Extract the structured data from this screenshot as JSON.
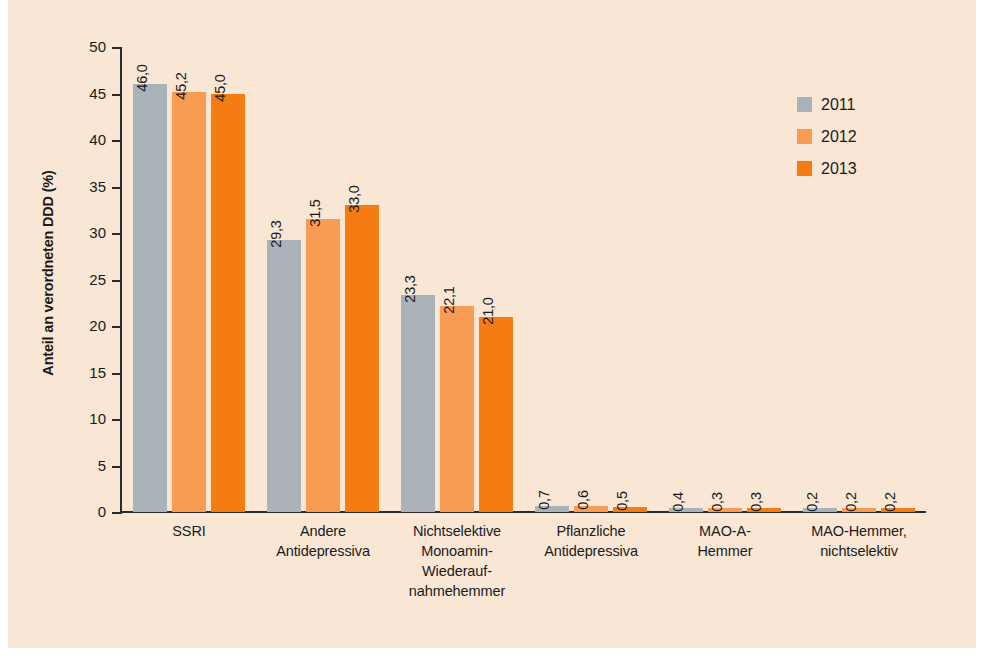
{
  "chart_data": {
    "type": "bar",
    "title": "",
    "subtitle": "",
    "xlabel": "",
    "ylabel": "Anteil an verordneten DDD (%)",
    "ylim": [
      0,
      50
    ],
    "yticks": [
      0,
      5,
      10,
      15,
      20,
      25,
      30,
      35,
      40,
      45,
      50
    ],
    "ytick_labels": [
      "0",
      "5",
      "10",
      "15",
      "20",
      "25",
      "30",
      "35",
      "40",
      "45",
      "50"
    ],
    "grid": false,
    "legend_position": "top-right",
    "decimal_separator": ",",
    "categories": [
      "SSRI",
      "Andere\nAntidepressiva",
      "Nichtselektive\nMonoamin-\nWiederauf-\nnahmehemmer",
      "Pflanzliche\nAntidepressiva",
      "MAO-A-\nHemmer",
      "MAO-Hemmer,\nnichtselektiv"
    ],
    "category_lines": [
      [
        "SSRI"
      ],
      [
        "Andere",
        "Antidepressiva"
      ],
      [
        "Nichtselektive",
        "Monoamin-",
        "Wiederauf-",
        "nahmehemmer"
      ],
      [
        "Pflanzliche",
        "Antidepressiva"
      ],
      [
        "MAO-A-",
        "Hemmer"
      ],
      [
        "MAO-Hemmer,",
        "nichtselektiv"
      ]
    ],
    "series": [
      {
        "name": "2011",
        "color": "#a9b2b9",
        "values": [
          46.0,
          29.3,
          23.3,
          0.7,
          0.4,
          0.2
        ],
        "labels": [
          "46,0",
          "29,3",
          "23,3",
          "0,7",
          "0,4",
          "0,2"
        ]
      },
      {
        "name": "2012",
        "color": "#f89c55",
        "values": [
          45.2,
          31.5,
          22.1,
          0.6,
          0.3,
          0.2
        ],
        "labels": [
          "45,2",
          "31,5",
          "22,1",
          "0,6",
          "0,3",
          "0,2"
        ]
      },
      {
        "name": "2013",
        "color": "#f47c13",
        "values": [
          45.0,
          33.0,
          21.0,
          0.5,
          0.3,
          0.2
        ],
        "labels": [
          "45,0",
          "33,0",
          "21,0",
          "0,5",
          "0,3",
          "0,2"
        ]
      }
    ]
  },
  "legend": {
    "items": [
      {
        "label": "2011",
        "color": "#a9b2b9"
      },
      {
        "label": "2012",
        "color": "#f89c55"
      },
      {
        "label": "2013",
        "color": "#f47c13"
      }
    ]
  },
  "colors": {
    "background": "#f9e6d4",
    "page": "#ffffff",
    "axis": "#2b2b2b",
    "text": "#1a1a1a",
    "series_2011": "#a9b2b9",
    "series_2012": "#f89c55",
    "series_2013": "#f47c13"
  }
}
